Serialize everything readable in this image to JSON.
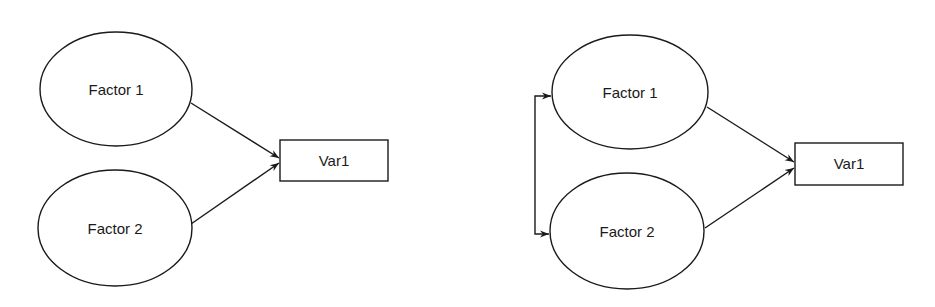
{
  "diagrams": [
    {
      "name": "uncorrelated-factors-model",
      "nodes": [
        {
          "id": "f1",
          "type": "ellipse",
          "label": "Factor 1"
        },
        {
          "id": "f2",
          "type": "ellipse",
          "label": "Factor 2"
        },
        {
          "id": "v1",
          "type": "rectangle",
          "label": "Var1"
        }
      ],
      "edges": [
        {
          "from": "f1",
          "to": "v1",
          "type": "directed"
        },
        {
          "from": "f2",
          "to": "v1",
          "type": "directed"
        }
      ]
    },
    {
      "name": "correlated-factors-model",
      "nodes": [
        {
          "id": "f1",
          "type": "ellipse",
          "label": "Factor 1"
        },
        {
          "id": "f2",
          "type": "ellipse",
          "label": "Factor 2"
        },
        {
          "id": "v1",
          "type": "rectangle",
          "label": "Var1"
        }
      ],
      "edges": [
        {
          "from": "f1",
          "to": "v1",
          "type": "directed"
        },
        {
          "from": "f2",
          "to": "v1",
          "type": "directed"
        },
        {
          "from": "f1",
          "to": "f2",
          "type": "bidirectional-covariance"
        }
      ]
    }
  ],
  "colors": {
    "stroke": "#1a1a1a",
    "background": "#ffffff"
  }
}
